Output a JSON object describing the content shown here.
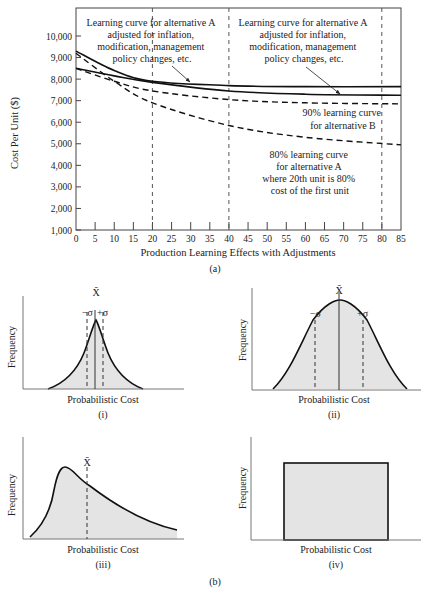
{
  "figure": {
    "panel_a_label": "(a)",
    "panel_b_label": "(b)"
  },
  "chart_data": [
    {
      "id": "a",
      "type": "line",
      "title": "",
      "xlabel": "Production Learning Effects with Adjustments",
      "ylabel": "Cost Per Unit ($)",
      "xlim": [
        0,
        85
      ],
      "ylim": [
        1000,
        11000
      ],
      "x_ticks": [
        "0",
        "5",
        "10",
        "15",
        "20",
        "25",
        "30",
        "35",
        "40",
        "45",
        "50",
        "55",
        "60",
        "65",
        "70",
        "75",
        "80",
        "85"
      ],
      "y_ticks": [
        "1,000",
        "2,000",
        "3,000",
        "4,000",
        "5,000",
        "6,000",
        "7,000",
        "8,000",
        "9,000",
        "10,000"
      ],
      "grid": false,
      "vertical_reference_lines": [
        20,
        40,
        80
      ],
      "series": [
        {
          "name": "Learning curve for alternative A adjusted (upper solid)",
          "style": "solid",
          "x": [
            0,
            10,
            20,
            40,
            60,
            85
          ],
          "y": [
            9300,
            8400,
            7900,
            7700,
            7650,
            7650
          ]
        },
        {
          "name": "Learning curve for alternative A adjusted (lower solid)",
          "style": "solid",
          "x": [
            0,
            10,
            20,
            40,
            60,
            85
          ],
          "y": [
            8500,
            8150,
            7850,
            7450,
            7300,
            7250
          ]
        },
        {
          "name": "90% learning curve for alternative B",
          "style": "dashed",
          "x": [
            0,
            10,
            20,
            40,
            60,
            85
          ],
          "y": [
            8500,
            7900,
            7450,
            7050,
            6900,
            6850
          ]
        },
        {
          "name": "80% learning curve for alternative A",
          "style": "dashed",
          "x": [
            0,
            10,
            20,
            40,
            60,
            85
          ],
          "y": [
            9200,
            7900,
            6900,
            5850,
            5300,
            4950
          ]
        }
      ],
      "annotations": [
        {
          "text": [
            "Learning curve for alternative A",
            "adjusted for inflation,",
            "modification, management",
            "policy changes, etc."
          ],
          "position": "upper-left",
          "arrow_to": [
            31,
            7900
          ]
        },
        {
          "text": [
            "Learning curve for alternative A",
            "adjusted for inflation,",
            "modification, management",
            "policy changes, etc."
          ],
          "position": "upper-right",
          "arrow_to": [
            62,
            7300
          ]
        },
        {
          "text": [
            "90% learning curve",
            "for alternative B"
          ],
          "position": "right-middle"
        },
        {
          "text": [
            "80% learning curve",
            "for alternative A",
            "where 20th unit is 80%",
            "cost of the first unit"
          ],
          "position": "lower-right"
        }
      ]
    },
    {
      "id": "b-i",
      "type": "area",
      "label": "(i)",
      "xlabel": "Probabilistic Cost",
      "ylabel": "Frequency",
      "shape": "peaked symmetric (leptokurtic)",
      "markers": [
        "−σ",
        "X̄",
        "+σ"
      ]
    },
    {
      "id": "b-ii",
      "type": "area",
      "label": "(ii)",
      "xlabel": "Probabilistic Cost",
      "ylabel": "Frequency",
      "shape": "normal (wide bell)",
      "markers": [
        "−σ",
        "X̄",
        "+σ"
      ]
    },
    {
      "id": "b-iii",
      "type": "area",
      "label": "(iii)",
      "xlabel": "Probabilistic Cost",
      "ylabel": "Frequency",
      "shape": "right-skewed",
      "markers": [
        "X̄"
      ]
    },
    {
      "id": "b-iv",
      "type": "area",
      "label": "(iv)",
      "xlabel": "Probabilistic Cost",
      "ylabel": "Frequency",
      "shape": "uniform (rectangular)",
      "markers": []
    }
  ],
  "labels": {
    "ann1": [
      "Learning curve for alternative A",
      "adjusted for inflation,",
      "modification, management",
      "policy changes, etc."
    ],
    "ann3": [
      "90% learning curve",
      "for alternative B"
    ],
    "ann4": [
      "80% learning curve",
      "for alternative A",
      "where 20th unit is 80%",
      "cost of the first unit"
    ],
    "xbar": "X̄",
    "minus_sigma": "−σ",
    "plus_sigma": "+σ"
  }
}
